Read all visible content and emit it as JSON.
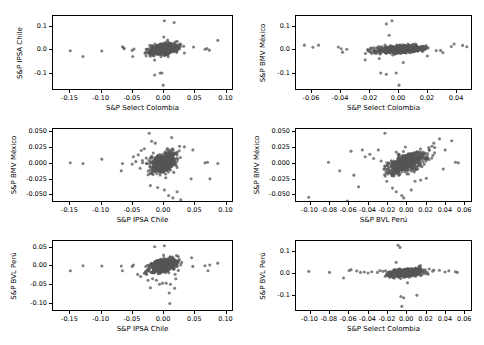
{
  "figure": {
    "type": "scatter-matrix",
    "background": "#ffffff",
    "marker_color": "#555555",
    "marker_alpha": 0.75,
    "marker_size_px": 3.2,
    "axis_color": "#000000",
    "rows": 3,
    "cols": 2
  },
  "chart_data": [
    {
      "id": "panel-top-left",
      "type": "scatter",
      "title": "",
      "xlabel": "S&P Select Colombia",
      "ylabel": "S&P IPSA Chile",
      "xticks": [
        -0.15,
        -0.1,
        -0.05,
        0.0,
        0.05,
        0.1
      ],
      "xticklabels": [
        "-0.15",
        "-0.10",
        "-0.05",
        "0.00",
        "0.05",
        "0.10"
      ],
      "yticks": [
        -0.1,
        0.0,
        0.1
      ],
      "yticklabels": [
        "-0.1",
        "0.0",
        "0.1"
      ],
      "xlim": [
        -0.178,
        0.112
      ],
      "ylim": [
        -0.175,
        0.148
      ],
      "grid": false,
      "legend": null,
      "n_points": 620,
      "corr": 0.33,
      "cluster": {
        "cx": 0.0005,
        "cy": 0.0008,
        "sx": 0.011,
        "sy": 0.012
      },
      "outliers": [
        [
          -0.152,
          -0.006
        ],
        [
          -0.131,
          -0.031
        ],
        [
          -0.1,
          -0.007
        ],
        [
          -0.066,
          0.012
        ],
        [
          -0.064,
          0.007
        ],
        [
          -0.063,
          0.003
        ],
        [
          -0.05,
          -0.004
        ],
        [
          -0.049,
          -0.031
        ],
        [
          -0.047,
          0.002
        ],
        [
          -0.013,
          -0.113
        ],
        [
          -0.004,
          -0.104
        ],
        [
          -0.001,
          -0.104
        ],
        [
          0.001,
          -0.158
        ],
        [
          0.003,
          0.127
        ],
        [
          0.019,
          0.119
        ],
        [
          0.002,
          0.055
        ],
        [
          0.07,
          0.001
        ],
        [
          0.073,
          0.004
        ],
        [
          0.077,
          -0.003
        ],
        [
          0.091,
          0.04
        ],
        [
          0.051,
          0.011
        ],
        [
          0.036,
          -0.016
        ],
        [
          -0.013,
          -0.047
        ],
        [
          -0.02,
          -0.03
        ]
      ]
    },
    {
      "id": "panel-top-right",
      "type": "scatter",
      "title": "",
      "xlabel": "S&P Select Colombia",
      "ylabel": "S&P BMV México",
      "xticks": [
        -0.06,
        -0.04,
        -0.02,
        0.0,
        0.02,
        0.04
      ],
      "xticklabels": [
        "-0.06",
        "-0.04",
        "-0.02",
        "0.00",
        "0.02",
        "0.04"
      ],
      "yticks": [
        -0.1,
        0.0,
        0.1
      ],
      "yticklabels": [
        "-0.1",
        "0.0",
        "0.1"
      ],
      "xlim": [
        -0.071,
        0.051
      ],
      "ylim": [
        -0.175,
        0.148
      ],
      "grid": false,
      "legend": null,
      "n_points": 620,
      "corr": 0.3,
      "cluster": {
        "cx": 0.0004,
        "cy": 0.0004,
        "sx": 0.0085,
        "sy": 0.0085
      },
      "outliers": [
        [
          -0.066,
          0.019
        ],
        [
          -0.06,
          0.01
        ],
        [
          -0.056,
          0.019
        ],
        [
          -0.042,
          0.011
        ],
        [
          -0.04,
          0.003
        ],
        [
          -0.039,
          -0.012
        ],
        [
          -0.036,
          0.001
        ],
        [
          -0.023,
          -0.046
        ],
        [
          -0.013,
          -0.04
        ],
        [
          -0.008,
          -0.11
        ],
        [
          -0.012,
          -0.104
        ],
        [
          -0.001,
          -0.104
        ],
        [
          0.001,
          -0.158
        ],
        [
          -0.004,
          0.127
        ],
        [
          -0.008,
          0.113
        ],
        [
          -0.006,
          0.063
        ],
        [
          0.004,
          -0.058
        ],
        [
          0.038,
          0.013
        ],
        [
          0.04,
          0.024
        ],
        [
          0.046,
          0.018
        ],
        [
          0.049,
          0.012
        ],
        [
          0.032,
          -0.014
        ],
        [
          0.021,
          -0.029
        ]
      ]
    },
    {
      "id": "panel-middle-left",
      "type": "scatter",
      "title": "",
      "xlabel": "S&P IPSA Chile",
      "ylabel": "S&P BMV México",
      "xticks": [
        -0.15,
        -0.1,
        -0.05,
        0.0,
        0.05,
        0.1
      ],
      "xticklabels": [
        "-0.15",
        "-0.10",
        "-0.05",
        "0.00",
        "0.05",
        "0.10"
      ],
      "yticks": [
        -0.05,
        -0.025,
        0.0,
        0.025,
        0.05
      ],
      "yticklabels": [
        "-0.050",
        "-0.025",
        "0.000",
        "0.025",
        "0.050"
      ],
      "xlim": [
        -0.178,
        0.112
      ],
      "ylim": [
        -0.062,
        0.055
      ],
      "grid": false,
      "legend": null,
      "n_points": 620,
      "corr": 0.38,
      "cluster": {
        "cx": 0.0006,
        "cy": 0.0004,
        "sx": 0.011,
        "sy": 0.0078
      },
      "outliers": [
        [
          -0.152,
          0.0
        ],
        [
          -0.131,
          -0.001
        ],
        [
          -0.1,
          0.006
        ],
        [
          -0.066,
          -0.001
        ],
        [
          -0.068,
          -0.013
        ],
        [
          -0.05,
          -0.002
        ],
        [
          -0.048,
          0.01
        ],
        [
          -0.044,
          0.002
        ],
        [
          -0.04,
          0.013
        ],
        [
          -0.035,
          0.02
        ],
        [
          -0.03,
          0.023
        ],
        [
          -0.022,
          0.048
        ],
        [
          -0.018,
          0.035
        ],
        [
          -0.012,
          0.032
        ],
        [
          -0.02,
          -0.037
        ],
        [
          -0.008,
          -0.04
        ],
        [
          0.003,
          -0.044
        ],
        [
          0.01,
          -0.053
        ],
        [
          0.017,
          -0.057
        ],
        [
          0.024,
          -0.047
        ],
        [
          0.03,
          -0.06
        ],
        [
          0.028,
          0.027
        ],
        [
          0.036,
          0.026
        ],
        [
          0.047,
          -0.026
        ],
        [
          0.05,
          0.021
        ],
        [
          0.07,
          0.0
        ],
        [
          0.074,
          0.001
        ],
        [
          0.078,
          -0.026
        ],
        [
          0.091,
          -0.001
        ],
        [
          0.015,
          0.041
        ]
      ]
    },
    {
      "id": "panel-middle-right",
      "type": "scatter",
      "title": "",
      "xlabel": "S&P BVL Perú",
      "ylabel": "S&P BMV México",
      "xticks": [
        -0.1,
        -0.08,
        -0.06,
        -0.04,
        -0.02,
        0.0,
        0.02,
        0.04,
        0.06
      ],
      "xticklabels": [
        "-0.10",
        "-0.08",
        "-0.06",
        "-0.04",
        "-0.02",
        "0.00",
        "0.02",
        "0.04",
        "0.06"
      ],
      "yticks": [
        -0.05,
        -0.025,
        0.0,
        0.025,
        0.05
      ],
      "yticklabels": [
        "-0.050",
        "-0.025",
        "0.000",
        "0.025",
        "0.050"
      ],
      "xlim": [
        -0.115,
        0.068
      ],
      "ylim": [
        -0.062,
        0.055
      ],
      "grid": false,
      "legend": null,
      "n_points": 620,
      "corr": 0.52,
      "cluster": {
        "cx": 0.0004,
        "cy": 0.0005,
        "sx": 0.0095,
        "sy": 0.0082
      },
      "outliers": [
        [
          -0.103,
          -0.056
        ],
        [
          -0.082,
          0.001
        ],
        [
          -0.07,
          -0.013
        ],
        [
          -0.062,
          -0.062
        ],
        [
          -0.058,
          0.019
        ],
        [
          -0.055,
          -0.02
        ],
        [
          -0.05,
          -0.039
        ],
        [
          -0.046,
          0.021
        ],
        [
          -0.043,
          0.01
        ],
        [
          -0.038,
          0.014
        ],
        [
          -0.034,
          0.007
        ],
        [
          -0.029,
          0.021
        ],
        [
          -0.026,
          0.003
        ],
        [
          -0.022,
          0.048
        ],
        [
          -0.02,
          -0.03
        ],
        [
          -0.014,
          -0.041
        ],
        [
          -0.01,
          -0.047
        ],
        [
          -0.004,
          -0.053
        ],
        [
          -0.002,
          -0.057
        ],
        [
          0.006,
          -0.044
        ],
        [
          0.01,
          -0.03
        ],
        [
          0.016,
          -0.028
        ],
        [
          0.022,
          -0.025
        ],
        [
          0.028,
          0.027
        ],
        [
          0.031,
          0.025
        ],
        [
          0.036,
          0.039
        ],
        [
          0.042,
          0.021
        ],
        [
          0.049,
          0.036
        ],
        [
          0.053,
          0.001
        ],
        [
          0.056,
          0.0
        ],
        [
          0.04,
          -0.01
        ],
        [
          0.03,
          0.032
        ]
      ]
    },
    {
      "id": "panel-bottom-left",
      "type": "scatter",
      "title": "",
      "xlabel": "S&P IPSA Chile",
      "ylabel": "S&P BVL Perú",
      "xticks": [
        -0.15,
        -0.1,
        -0.05,
        0.0,
        0.05,
        0.1
      ],
      "xticklabels": [
        "-0.15",
        "-0.10",
        "-0.05",
        "0.00",
        "0.05",
        "0.10"
      ],
      "yticks": [
        -0.1,
        -0.05,
        0.0,
        0.05
      ],
      "yticklabels": [
        "-0.10",
        "-0.05",
        "0.00",
        "0.05"
      ],
      "xlim": [
        -0.178,
        0.112
      ],
      "ylim": [
        -0.122,
        0.068
      ],
      "grid": false,
      "legend": null,
      "n_points": 620,
      "corr": 0.35,
      "cluster": {
        "cx": 0.0006,
        "cy": 0.0004,
        "sx": 0.011,
        "sy": 0.0095
      },
      "outliers": [
        [
          -0.152,
          -0.014
        ],
        [
          -0.131,
          0.0
        ],
        [
          -0.1,
          -0.001
        ],
        [
          -0.068,
          -0.001
        ],
        [
          -0.066,
          -0.014
        ],
        [
          -0.05,
          -0.002
        ],
        [
          -0.048,
          0.002
        ],
        [
          -0.041,
          -0.024
        ],
        [
          -0.036,
          -0.03
        ],
        [
          -0.03,
          -0.021
        ],
        [
          -0.024,
          -0.04
        ],
        [
          -0.02,
          -0.061
        ],
        [
          -0.01,
          -0.04
        ],
        [
          -0.005,
          -0.051
        ],
        [
          0.0,
          -0.048
        ],
        [
          0.006,
          -0.048
        ],
        [
          0.011,
          -0.075
        ],
        [
          0.012,
          -0.104
        ],
        [
          0.013,
          -0.051
        ],
        [
          0.02,
          -0.062
        ],
        [
          0.022,
          -0.036
        ],
        [
          0.026,
          0.025
        ],
        [
          0.003,
          0.055
        ],
        [
          -0.013,
          0.052
        ],
        [
          0.05,
          -0.002
        ],
        [
          0.048,
          0.022
        ],
        [
          0.07,
          0.0
        ],
        [
          0.075,
          -0.014
        ],
        [
          0.078,
          0.002
        ],
        [
          0.091,
          0.007
        ]
      ]
    },
    {
      "id": "panel-bottom-right",
      "type": "scatter",
      "title": "",
      "xlabel": "S&P Select Colombia",
      "ylabel": "S&P BVL Perú",
      "xticks": [
        -0.1,
        -0.08,
        -0.06,
        -0.04,
        -0.02,
        0.0,
        0.02,
        0.04,
        0.06
      ],
      "xticklabels": [
        "-0.10",
        "-0.08",
        "-0.06",
        "-0.04",
        "-0.02",
        "0.00",
        "0.02",
        "0.04",
        "0.06"
      ],
      "yticks": [
        -0.1,
        0.0,
        0.1
      ],
      "yticklabels": [
        "-0.1",
        "0.0",
        "0.1"
      ],
      "xlim": [
        -0.115,
        0.068
      ],
      "ylim": [
        -0.175,
        0.148
      ],
      "grid": false,
      "legend": null,
      "n_points": 620,
      "corr": 0.28,
      "cluster": {
        "cx": 0.0003,
        "cy": 0.0004,
        "sx": 0.0088,
        "sy": 0.0082
      },
      "outliers": [
        [
          -0.103,
          0.006
        ],
        [
          -0.081,
          0.001
        ],
        [
          -0.066,
          -0.025
        ],
        [
          -0.06,
          0.01
        ],
        [
          -0.058,
          0.014
        ],
        [
          -0.052,
          0.008
        ],
        [
          -0.048,
          0.001
        ],
        [
          -0.044,
          0.003
        ],
        [
          -0.04,
          -0.002
        ],
        [
          -0.036,
          0.004
        ],
        [
          -0.03,
          0.001
        ],
        [
          -0.024,
          0.006
        ],
        [
          -0.008,
          0.128
        ],
        [
          -0.006,
          0.118
        ],
        [
          -0.01,
          0.048
        ],
        [
          -0.005,
          -0.112
        ],
        [
          -0.002,
          -0.118
        ],
        [
          -0.004,
          -0.158
        ],
        [
          0.012,
          -0.106
        ],
        [
          0.002,
          -0.048
        ],
        [
          0.016,
          0.033
        ],
        [
          0.03,
          0.012
        ],
        [
          0.036,
          0.011
        ],
        [
          0.042,
          0.003
        ],
        [
          0.046,
          0.009
        ],
        [
          0.053,
          0.004
        ],
        [
          0.055,
          0.001
        ]
      ]
    }
  ]
}
